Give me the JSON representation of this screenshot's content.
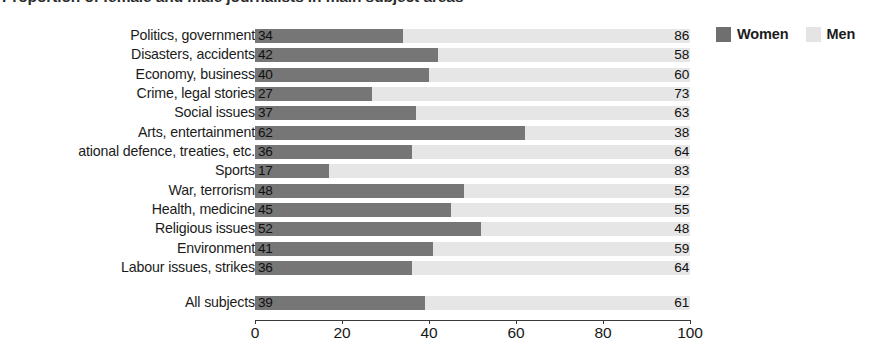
{
  "chart_data": {
    "type": "bar",
    "orientation": "horizontal",
    "stacked": true,
    "normalized_percent": true,
    "title": "Proportion of female and male journalists in main subject areas",
    "xlabel": "",
    "ylabel": "",
    "xlim": [
      0,
      100
    ],
    "xticks": [
      0,
      20,
      40,
      60,
      80,
      100
    ],
    "grid": false,
    "legend_position": "top-right",
    "categories": [
      "Politics, government",
      "Disasters, accidents",
      "Economy, business",
      "Crime, legal stories",
      "Social issues",
      "Arts, entertainment",
      "ational defence, treaties, etc.",
      "Sports",
      "War, terrorism",
      "Health, medicine",
      "Religious issues",
      "Environment",
      "Labour issues, strikes"
    ],
    "summary_category": "All subjects",
    "series": [
      {
        "name": "Women",
        "color": "#767676",
        "values": [
          34,
          42,
          40,
          27,
          37,
          62,
          36,
          17,
          48,
          45,
          52,
          41,
          36
        ],
        "summary_value": 39
      },
      {
        "name": "Men",
        "color": "#e6e6e6",
        "values": [
          86,
          58,
          60,
          73,
          63,
          38,
          64,
          83,
          52,
          55,
          48,
          59,
          64
        ],
        "summary_value": 61
      }
    ]
  },
  "legend": {
    "items": [
      {
        "label": "Women",
        "swatch": "women-swatch",
        "color": "#6f6f6f"
      },
      {
        "label": "Men",
        "swatch": "men-swatch",
        "color": "#e4e4e4"
      }
    ]
  },
  "axis": {
    "tick_labels": [
      "0",
      "20",
      "40",
      "60",
      "80",
      "100"
    ]
  }
}
